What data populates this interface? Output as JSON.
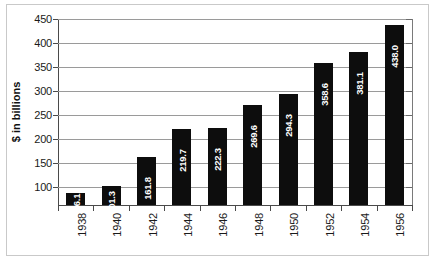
{
  "chart_data": {
    "type": "bar",
    "title": "",
    "subtitle": "",
    "xlabel": "",
    "ylabel": "$ in billions",
    "categories": [
      "1938",
      "1940",
      "1942",
      "1944",
      "1946",
      "1948",
      "1950",
      "1952",
      "1954",
      "1956"
    ],
    "values": [
      86.1,
      101.3,
      161.8,
      219.7,
      222.3,
      269.6,
      294.3,
      358.6,
      381.1,
      438.0
    ],
    "value_labels": [
      "86.1",
      "101.3",
      "161.8",
      "219.7",
      "222.3",
      "269.6",
      "294.3",
      "358.6",
      "381.1",
      "438.0"
    ],
    "y_ticks": [
      450,
      400,
      350,
      300,
      250,
      200,
      150,
      100
    ],
    "y_tick_labels": [
      "450",
      "400",
      "350",
      "300",
      "250",
      "200",
      "150",
      "100"
    ],
    "ylim": [
      62,
      450
    ],
    "grid": "horizontal",
    "legend": "none",
    "bar_color": "#0d0d0d",
    "value_label_color": "#ffffff",
    "gridline_color": "#9a9a9a",
    "axis_color": "#4a4a4a",
    "frame_color": "#c9c9c9",
    "background_color": "#ffffff"
  }
}
